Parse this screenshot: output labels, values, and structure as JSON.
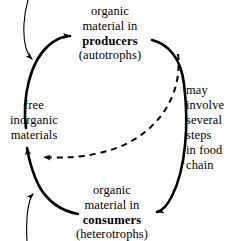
{
  "diagram": {
    "background_color": "#ffffff",
    "ink_color": "#000000"
  },
  "labels": {
    "producers": {
      "line1": "organic",
      "line2": "material in",
      "line3": "producers",
      "line4": "(autotrophs)"
    },
    "free_inorganic": {
      "line1": "free",
      "line2": "inorganic",
      "line3": "materials"
    },
    "food_chain": {
      "line1": "may",
      "line2": "involve",
      "line3": "several",
      "line4": "steps",
      "line5": "in food",
      "line6": "chain"
    },
    "consumers": {
      "line1": "organic",
      "line2": "material in",
      "line3": "consumers",
      "line4": "(heterotrophs)"
    }
  },
  "arrows": [
    {
      "name": "free-inorganic-to-producers",
      "style": "thick-solid",
      "from": "free inorganic materials",
      "to": "organic material in producers"
    },
    {
      "name": "producers-to-consumers",
      "style": "thick-solid",
      "from": "organic material in producers",
      "to": "organic material in consumers"
    },
    {
      "name": "consumers-to-free-inorganic",
      "style": "thick-solid",
      "from": "organic material in consumers",
      "to": "free inorganic materials"
    },
    {
      "name": "producers-to-free-inorganic-shortcut",
      "style": "dashed",
      "from": "organic material in producers",
      "to": "free inorganic materials"
    },
    {
      "name": "external-input-top",
      "style": "thin-solid",
      "from": "off-page top",
      "to": "free inorganic materials"
    },
    {
      "name": "external-input-bottom",
      "style": "thin-solid",
      "from": "off-page bottom",
      "to": "free inorganic materials"
    }
  ]
}
